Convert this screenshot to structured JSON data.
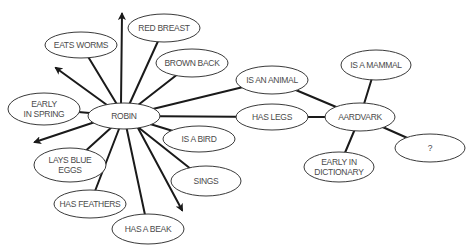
{
  "diagram": {
    "title": "",
    "colors": {
      "edge": "#1a1a1a",
      "node_stroke": "#3a3a3a",
      "node_fill": "#ffffff",
      "label": "#4a4a4a"
    },
    "nodes": [
      {
        "id": "robin",
        "lines": [
          "ROBIN"
        ],
        "cx": 124,
        "cy": 116,
        "rx": 36,
        "ry": 13
      },
      {
        "id": "eats-worms",
        "lines": [
          "EATS WORMS"
        ],
        "cx": 81,
        "cy": 45,
        "rx": 36,
        "ry": 13
      },
      {
        "id": "red-breast",
        "lines": [
          "RED BREAST"
        ],
        "cx": 164,
        "cy": 28,
        "rx": 36,
        "ry": 14
      },
      {
        "id": "brown-back",
        "lines": [
          "BROWN BACK"
        ],
        "cx": 192,
        "cy": 63,
        "rx": 36,
        "ry": 14
      },
      {
        "id": "early-in-spring",
        "lines": [
          "EARLY",
          "IN SPRING"
        ],
        "cx": 44,
        "cy": 109,
        "rx": 36,
        "ry": 16
      },
      {
        "id": "is-a-bird",
        "lines": [
          "IS A BIRD"
        ],
        "cx": 199,
        "cy": 139,
        "rx": 36,
        "ry": 13
      },
      {
        "id": "lays-blue-eggs",
        "lines": [
          "LAYS BLUE",
          "EGGS"
        ],
        "cx": 70,
        "cy": 165,
        "rx": 36,
        "ry": 17
      },
      {
        "id": "has-feathers",
        "lines": [
          "HAS FEATHERS"
        ],
        "cx": 90,
        "cy": 204,
        "rx": 36,
        "ry": 14
      },
      {
        "id": "has-a-beak",
        "lines": [
          "HAS A BEAK"
        ],
        "cx": 148,
        "cy": 229,
        "rx": 36,
        "ry": 15
      },
      {
        "id": "sings",
        "lines": [
          "SINGS"
        ],
        "cx": 206,
        "cy": 181,
        "rx": 35,
        "ry": 15
      },
      {
        "id": "is-an-animal",
        "lines": [
          "IS AN ANIMAL"
        ],
        "cx": 272,
        "cy": 80,
        "rx": 36,
        "ry": 14
      },
      {
        "id": "has-legs",
        "lines": [
          "HAS LEGS"
        ],
        "cx": 272,
        "cy": 117,
        "rx": 36,
        "ry": 13
      },
      {
        "id": "aardvark",
        "lines": [
          "AARDVARK"
        ],
        "cx": 360,
        "cy": 117,
        "rx": 35,
        "ry": 14
      },
      {
        "id": "is-a-mammal",
        "lines": [
          "IS A MAMMAL"
        ],
        "cx": 376,
        "cy": 65,
        "rx": 35,
        "ry": 15
      },
      {
        "id": "unknown",
        "lines": [
          "?"
        ],
        "cx": 430,
        "cy": 148,
        "rx": 35,
        "ry": 14
      },
      {
        "id": "early-in-dictionary",
        "lines": [
          "EARLY IN",
          "DICTIONARY"
        ],
        "cx": 339,
        "cy": 167,
        "rx": 35,
        "ry": 15
      }
    ],
    "edges": [
      {
        "from": "robin",
        "to": "eats-worms"
      },
      {
        "from": "robin",
        "to": "red-breast"
      },
      {
        "from": "robin",
        "to": "brown-back"
      },
      {
        "from": "robin",
        "to": "early-in-spring"
      },
      {
        "from": "robin",
        "to": "is-a-bird"
      },
      {
        "from": "robin",
        "to": "lays-blue-eggs"
      },
      {
        "from": "robin",
        "to": "has-feathers"
      },
      {
        "from": "robin",
        "to": "has-a-beak"
      },
      {
        "from": "robin",
        "to": "sings"
      },
      {
        "from": "robin",
        "to": "is-an-animal"
      },
      {
        "from": "robin",
        "to": "has-legs"
      },
      {
        "from": "is-an-animal",
        "to": "aardvark"
      },
      {
        "from": "has-legs",
        "to": "aardvark"
      },
      {
        "from": "aardvark",
        "to": "is-a-mammal"
      },
      {
        "from": "aardvark",
        "to": "unknown"
      },
      {
        "from": "aardvark",
        "to": "early-in-dictionary"
      }
    ],
    "arrows": [
      {
        "from": "robin",
        "x1": 121,
        "y1": 104,
        "x2": 122,
        "y2": 14
      },
      {
        "from": "robin",
        "x1": 107,
        "y1": 105,
        "x2": 56,
        "y2": 68
      },
      {
        "from": "robin",
        "x1": 95,
        "y1": 122,
        "x2": 35,
        "y2": 142
      },
      {
        "from": "robin",
        "x1": 138,
        "y1": 128,
        "x2": 182,
        "y2": 210
      }
    ]
  }
}
